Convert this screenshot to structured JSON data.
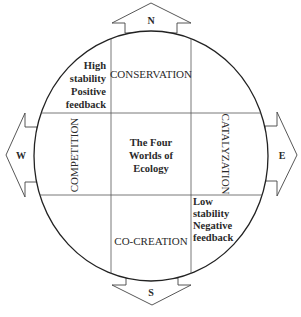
{
  "diagram": {
    "center_title": [
      "The Four",
      "Worlds of",
      "Ecology"
    ],
    "quadrants": {
      "north": "CONSERVATION",
      "west": "COMPETITION",
      "east": "CATALYZATION",
      "south": "CO-CREATION"
    },
    "annotations": {
      "top_left": [
        "High",
        "stability",
        "Positive",
        "feedback"
      ],
      "bottom_right": [
        "Low",
        "stability",
        "Negative",
        "feedback"
      ]
    },
    "compass": {
      "north": "N",
      "south": "S",
      "east": "E",
      "west": "W"
    },
    "colors": {
      "line": "#222222",
      "grid": "#555555",
      "text": "#2a2a2a",
      "background": "#ffffff"
    }
  }
}
